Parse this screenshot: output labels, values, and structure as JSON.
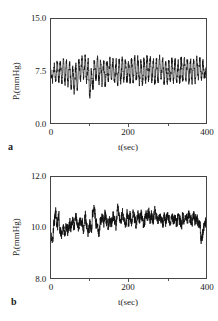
{
  "figure": {
    "panels": [
      {
        "key": "a",
        "label": "a",
        "y_axis_label_main": "P",
        "y_axis_label_sub": "t",
        "y_axis_label_rest": "(mmHg)",
        "y_axis_label_full": "Pt(mmHg)",
        "x_axis_label": "t(sec)",
        "y_ticks": [
          "0.0",
          "7.5",
          "15.0"
        ],
        "x_ticks": [
          "0",
          "200",
          "400"
        ]
      },
      {
        "key": "b",
        "label": "b",
        "y_axis_label_main": "P",
        "y_axis_label_sub": "t",
        "y_axis_label_rest": "(mmHg)",
        "y_axis_label_full": "Pt(mmHg)",
        "x_axis_label": "t(sec)",
        "y_ticks": [
          "8.0",
          "10.0",
          "12.0"
        ],
        "x_ticks": [
          "0",
          "200",
          "400"
        ]
      }
    ]
  },
  "chart_data": [
    {
      "type": "line",
      "panel": "a",
      "title": "",
      "xlabel": "t(sec)",
      "ylabel": "Pt(mmHg)",
      "xlim": [
        0,
        400
      ],
      "ylim": [
        0.0,
        15.0
      ],
      "xticks": [
        0,
        200,
        400
      ],
      "yticks": [
        0.0,
        7.5,
        15.0
      ],
      "grid": false,
      "legend": null,
      "description": "Large-amplitude regular oscillation of tissue pressure about a mean near 7.5 mmHg; roughly 14 cycles over 400 s (period about 29 s), peaks near 9.8 and troughs near 5.3 mmHg, with fine high-frequency noise riding on the slow wave.",
      "series": [
        {
          "name": "Pt",
          "x": [
            0,
            4,
            8,
            12,
            16,
            20,
            24,
            28,
            32,
            36,
            40,
            44,
            48,
            52,
            56,
            60,
            64,
            68,
            72,
            76,
            80,
            84,
            88,
            92,
            96,
            100,
            104,
            108,
            112,
            116,
            120,
            124,
            128,
            132,
            136,
            140,
            144,
            148,
            152,
            156,
            160,
            164,
            168,
            172,
            176,
            180,
            184,
            188,
            192,
            196,
            200,
            204,
            208,
            212,
            216,
            220,
            224,
            228,
            232,
            236,
            240,
            244,
            248,
            252,
            256,
            260,
            264,
            268,
            272,
            276,
            280,
            284,
            288,
            292,
            296,
            300,
            304,
            308,
            312,
            316,
            320,
            324,
            328,
            332,
            336,
            340,
            344,
            348,
            352,
            356,
            360,
            364,
            368,
            372,
            376,
            380,
            384,
            388,
            392,
            396,
            400
          ],
          "values": [
            7.2,
            6.3,
            8.3,
            6.0,
            8.7,
            6.2,
            8.9,
            6.1,
            9.0,
            5.9,
            8.8,
            5.6,
            8.6,
            5.0,
            7.9,
            4.4,
            8.2,
            5.1,
            9.1,
            6.3,
            9.6,
            6.6,
            9.4,
            6.0,
            8.8,
            3.9,
            7.4,
            5.2,
            8.9,
            6.4,
            9.3,
            6.1,
            8.8,
            5.6,
            8.6,
            5.5,
            9.0,
            6.1,
            9.4,
            6.3,
            9.2,
            5.9,
            8.8,
            5.8,
            9.0,
            6.0,
            9.3,
            6.2,
            9.1,
            5.9,
            8.7,
            5.7,
            9.0,
            6.1,
            9.4,
            6.2,
            9.2,
            5.8,
            8.8,
            5.7,
            9.1,
            6.2,
            9.5,
            6.4,
            9.3,
            6.0,
            8.9,
            5.8,
            9.0,
            6.1,
            9.3,
            6.2,
            9.1,
            5.9,
            8.8,
            5.7,
            9.0,
            6.0,
            9.2,
            6.1,
            9.0,
            5.8,
            8.7,
            5.9,
            9.1,
            6.2,
            9.3,
            6.1,
            9.0,
            5.9,
            8.8,
            5.8,
            9.0,
            6.0,
            9.2,
            6.3,
            9.3,
            6.5,
            8.6,
            6.8,
            7.6
          ]
        }
      ]
    },
    {
      "type": "line",
      "panel": "b",
      "title": "",
      "xlabel": "t(sec)",
      "ylabel": "Pt(mmHg)",
      "xlim": [
        0,
        400
      ],
      "ylim": [
        8.0,
        12.0
      ],
      "xticks": [
        0,
        200,
        400
      ],
      "yticks": [
        8.0,
        10.0,
        12.0
      ],
      "grid": false,
      "legend": null,
      "description": "Irregular, noisy tissue pressure fluctuating about a mean near 10.2 mmHg with no dominant slow oscillation; excursions mostly between 9.5 and 10.9 mmHg, with a minimum near 9.4 at the start and a sharp dip near 9.5 at the end.",
      "series": [
        {
          "name": "Pt",
          "x": [
            0,
            4,
            8,
            12,
            16,
            20,
            24,
            28,
            32,
            36,
            40,
            44,
            48,
            52,
            56,
            60,
            64,
            68,
            72,
            76,
            80,
            84,
            88,
            92,
            96,
            100,
            104,
            108,
            112,
            116,
            120,
            124,
            128,
            132,
            136,
            140,
            144,
            148,
            152,
            156,
            160,
            164,
            168,
            172,
            176,
            180,
            184,
            188,
            192,
            196,
            200,
            204,
            208,
            212,
            216,
            220,
            224,
            228,
            232,
            236,
            240,
            244,
            248,
            252,
            256,
            260,
            264,
            268,
            272,
            276,
            280,
            284,
            288,
            292,
            296,
            300,
            304,
            308,
            312,
            316,
            320,
            324,
            328,
            332,
            336,
            340,
            344,
            348,
            352,
            356,
            360,
            364,
            368,
            372,
            376,
            380,
            384,
            388,
            392,
            396,
            400
          ],
          "values": [
            9.6,
            9.5,
            10.2,
            10.6,
            10.0,
            10.55,
            9.85,
            9.7,
            10.0,
            9.75,
            10.05,
            9.85,
            10.15,
            10.0,
            10.3,
            10.05,
            10.45,
            10.1,
            10.0,
            10.35,
            10.15,
            9.95,
            10.45,
            10.15,
            9.8,
            10.1,
            9.9,
            10.6,
            10.75,
            10.2,
            10.0,
            9.75,
            10.25,
            10.45,
            10.2,
            10.5,
            10.25,
            10.05,
            10.35,
            10.15,
            10.45,
            10.3,
            10.05,
            10.8,
            10.45,
            10.2,
            10.55,
            10.3,
            10.1,
            10.5,
            10.25,
            10.45,
            10.2,
            10.6,
            10.35,
            10.15,
            10.5,
            10.3,
            10.55,
            10.3,
            10.1,
            10.5,
            10.35,
            10.6,
            10.3,
            10.5,
            10.3,
            10.75,
            10.45,
            10.25,
            10.5,
            10.3,
            10.1,
            10.45,
            10.25,
            10.5,
            10.3,
            10.15,
            10.45,
            10.25,
            10.4,
            10.2,
            10.45,
            10.3,
            10.1,
            10.4,
            10.25,
            10.45,
            10.3,
            10.5,
            10.3,
            10.2,
            10.45,
            10.25,
            10.4,
            10.2,
            10.1,
            9.5,
            9.8,
            10.15,
            10.25
          ]
        }
      ]
    }
  ]
}
